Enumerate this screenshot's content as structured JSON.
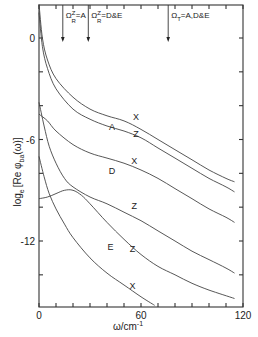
{
  "chart_data": {
    "type": "line",
    "title": "",
    "xlabel": "ω/cm⁻¹",
    "ylabel": "logₑ [Re φba(ω)]",
    "xlim": [
      0,
      120
    ],
    "ylim": [
      -15.8,
      2.0
    ],
    "xticks": [
      0,
      60,
      120
    ],
    "yticks": [
      0,
      -6,
      -12
    ],
    "xtick_labels": [
      "0",
      "60",
      "120"
    ],
    "ytick_labels": [
      "0",
      "-6",
      "-12"
    ],
    "grid": false,
    "legend": null,
    "series": [
      {
        "name": "A X",
        "x": [
          0,
          2,
          5,
          10,
          20,
          30,
          40,
          50,
          60,
          70,
          80,
          90,
          100,
          110,
          115
        ],
        "y": [
          2.0,
          0.0,
          -1.3,
          -2.4,
          -3.5,
          -4.2,
          -4.6,
          -4.9,
          -5.4,
          -6.0,
          -6.6,
          -7.2,
          -7.8,
          -8.3,
          -8.5
        ]
      },
      {
        "name": "A Z",
        "x": [
          0,
          2,
          5,
          10,
          20,
          30,
          40,
          50,
          60,
          70,
          80,
          90,
          100,
          110,
          115
        ],
        "y": [
          1.5,
          -0.5,
          -1.8,
          -3.0,
          -4.2,
          -4.8,
          -5.2,
          -5.5,
          -5.9,
          -6.5,
          -7.1,
          -7.7,
          -8.3,
          -8.8,
          -9.1
        ]
      },
      {
        "name": "D X",
        "x": [
          0,
          5,
          10,
          20,
          30,
          40,
          50,
          60,
          70,
          80,
          90,
          100,
          110,
          115
        ],
        "y": [
          -4.5,
          -4.9,
          -5.5,
          -6.3,
          -6.8,
          -7.1,
          -7.4,
          -7.8,
          -8.3,
          -8.9,
          -9.5,
          -10.1,
          -10.6,
          -10.9
        ]
      },
      {
        "name": "D Z",
        "x": [
          0,
          3,
          6,
          10,
          15,
          20,
          30,
          40,
          50,
          60,
          70,
          80,
          90,
          100,
          110,
          115
        ],
        "y": [
          -3.8,
          -5.2,
          -6.4,
          -7.4,
          -8.3,
          -8.8,
          -9.4,
          -9.8,
          -10.3,
          -10.8,
          -11.4,
          -12.0,
          -12.6,
          -13.1,
          -13.6,
          -13.9
        ]
      },
      {
        "name": "E Z",
        "x": [
          0,
          5,
          10,
          15,
          20,
          25,
          30,
          40,
          50,
          60,
          70,
          80,
          90,
          100,
          115
        ],
        "y": [
          -9.5,
          -9.4,
          -9.2,
          -9.0,
          -9.0,
          -9.3,
          -9.8,
          -10.9,
          -11.9,
          -12.8,
          -13.5,
          -14.0,
          -14.5,
          -14.9,
          -15.4
        ]
      },
      {
        "name": "E X",
        "x": [
          0,
          3,
          6,
          10,
          15,
          20,
          30,
          40,
          50,
          60,
          68
        ],
        "y": [
          -7.0,
          -8.2,
          -9.2,
          -10.1,
          -11.0,
          -11.8,
          -13.0,
          -13.9,
          -14.6,
          -15.3,
          -15.8
        ]
      }
    ],
    "curve_labels": [
      {
        "text": "X",
        "x": 57,
        "y": -4.6
      },
      {
        "text": "A",
        "x": 43,
        "y": -5.2
      },
      {
        "text": "Z",
        "x": 57,
        "y": -5.6
      },
      {
        "text": "D",
        "x": 43,
        "y": -7.8
      },
      {
        "text": "X",
        "x": 56,
        "y": -7.2
      },
      {
        "text": "Z",
        "x": 56,
        "y": -9.9
      },
      {
        "text": "E",
        "x": 42,
        "y": -12.3
      },
      {
        "text": "Z",
        "x": 55,
        "y": -12.4
      },
      {
        "text": "X",
        "x": 55,
        "y": -14.6
      }
    ],
    "annotations": [
      {
        "text": "Ω",
        "sub": "R",
        "sup": "Z",
        "rest": "=A",
        "arrow_x": 14
      },
      {
        "text": "Ω",
        "sub": "R",
        "sup": "Z",
        "rest": "=D&E",
        "arrow_x": 29
      },
      {
        "text": "Ω",
        "sub": "T",
        "sup": "",
        "rest": "=A,D&E",
        "arrow_x": 76
      }
    ]
  },
  "labels": {
    "xlabel": "ω/cm",
    "xlabel_sup": "-1",
    "ylabel_main": "log",
    "ylabel_sub": "e",
    "ylabel_rest": "[Re φ",
    "ylabel_sub2": "ba",
    "ylabel_end": "(ω)]"
  }
}
